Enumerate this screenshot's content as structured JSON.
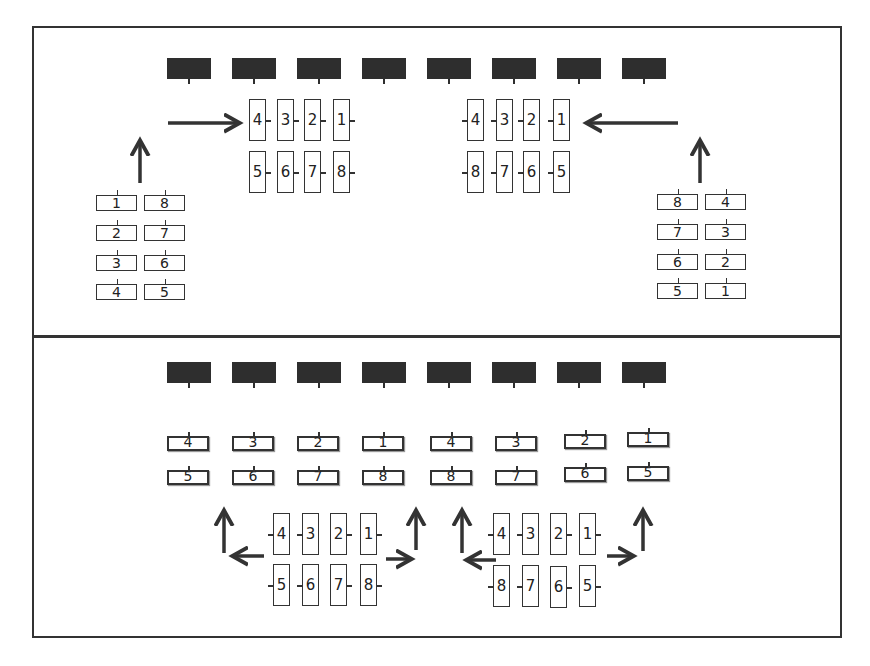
{
  "diagram": {
    "type": "seating/layout arrangement diagram",
    "panels": [
      {
        "name": "top-panel",
        "header_blocks": 8,
        "left_group_vertical": {
          "top_row": [
            "4",
            "3",
            "2",
            "1"
          ],
          "bottom_row": [
            "5",
            "6",
            "7",
            "8"
          ]
        },
        "right_group_vertical": {
          "top_row": [
            "4",
            "3",
            "2",
            "1"
          ],
          "bottom_row": [
            "8",
            "7",
            "6",
            "5"
          ]
        },
        "left_stack_horizontal": {
          "left_col": [
            "1",
            "2",
            "3",
            "4"
          ],
          "right_col": [
            "8",
            "7",
            "6",
            "5"
          ]
        },
        "right_stack_horizontal": {
          "left_col": [
            "8",
            "7",
            "6",
            "5"
          ],
          "right_col": [
            "4",
            "3",
            "2",
            "1"
          ]
        },
        "arrows": [
          "left-stack up",
          "right into left group",
          "right-stack up",
          "left into right group"
        ]
      },
      {
        "name": "bottom-panel",
        "header_blocks": 8,
        "horizontal_row": {
          "top_row": [
            "4",
            "3",
            "2",
            "1",
            "4",
            "3",
            "2",
            "1"
          ],
          "bottom_row": [
            "5",
            "6",
            "7",
            "8",
            "8",
            "7",
            "6",
            "5"
          ]
        },
        "left_group_vertical": {
          "top_row": [
            "4",
            "3",
            "2",
            "1"
          ],
          "bottom_row": [
            "5",
            "6",
            "7",
            "8"
          ]
        },
        "right_group_vertical": {
          "top_row": [
            "4",
            "3",
            "2",
            "1"
          ],
          "bottom_row": [
            "8",
            "7",
            "6",
            "5"
          ]
        },
        "arrows": [
          "left then up",
          "right then up",
          "left then up",
          "right then up"
        ]
      }
    ]
  },
  "colors": {
    "ink": "#333333",
    "block": "#2e2e2e",
    "background": "#ffffff"
  }
}
